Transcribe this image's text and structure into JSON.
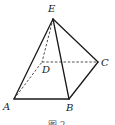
{
  "figure": {
    "type": "pyramid",
    "vertices": [
      {
        "name": "E",
        "label": "E",
        "x": 53,
        "y": 19,
        "label_x": 48,
        "label_y": 12
      },
      {
        "name": "D",
        "label": "D",
        "x": 42,
        "y": 62,
        "label_x": 42,
        "label_y": 73
      },
      {
        "name": "C",
        "label": "C",
        "x": 98,
        "y": 62,
        "label_x": 101,
        "label_y": 66
      },
      {
        "name": "A",
        "label": "A",
        "x": 14,
        "y": 99,
        "label_x": 3,
        "label_y": 110
      },
      {
        "name": "B",
        "label": "B",
        "x": 69,
        "y": 99,
        "label_x": 66,
        "label_y": 111
      }
    ],
    "edges": [
      {
        "from": "E",
        "to": "A",
        "style": "solid"
      },
      {
        "from": "E",
        "to": "B",
        "style": "solid"
      },
      {
        "from": "E",
        "to": "C",
        "style": "solid"
      },
      {
        "from": "A",
        "to": "B",
        "style": "solid"
      },
      {
        "from": "B",
        "to": "C",
        "style": "solid"
      },
      {
        "from": "E",
        "to": "D",
        "style": "dashed"
      },
      {
        "from": "D",
        "to": "C",
        "style": "dashed"
      },
      {
        "from": "A",
        "to": "D",
        "style": "dashed"
      }
    ],
    "caption": "图 2",
    "colors": {
      "line": "#1a1a1a",
      "background": "#ffffff"
    }
  }
}
